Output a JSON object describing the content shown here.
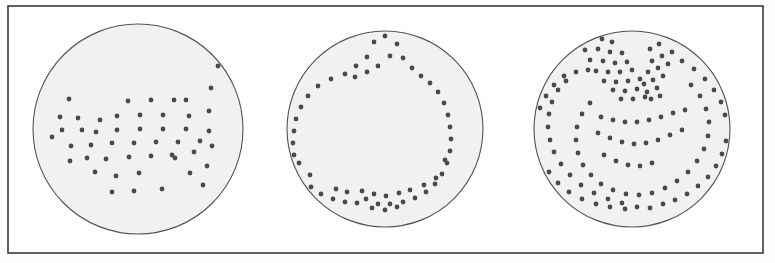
{
  "figure": {
    "background_color": "#fefefe",
    "frame": {
      "name": "outer-border",
      "x": 8,
      "y": 6,
      "width": 755,
      "height": 247,
      "stroke_color": "#3a3a3a",
      "stroke_width": 1.6,
      "fill_color": "#ffffff"
    },
    "disc_style": {
      "fill_color": "#f2f1ef",
      "stroke_color": "#55524e",
      "stroke_width": 1.1
    },
    "dot_style": {
      "fill_color": "#4a4a4a",
      "radius": 2.4
    }
  },
  "chart_data": {
    "type": "scatter",
    "xlabel": "",
    "ylabel": "",
    "xlim": [
      0,
      775
    ],
    "ylim": [
      263,
      0
    ],
    "grid": false,
    "legend": "none",
    "annotations": [
      "Panel 1 (left): loose rectangular lattice of dots forming an arrow-like / chevron cluster in the centre with an isolated vertical file of dots at the right.",
      "Panel 2 (middle): a single closed ring of dots tracing a rounded pentagon with a pointed apex at the top and a V notch at the bottom.",
      "Panel 3 (right): dense multi-layered pattern with a crossed X / butterfly motif at the top and nested arcs filling the lower half."
    ],
    "series": [
      {
        "name": "panel-1-dots",
        "marker": "circle",
        "color": "#4a4a4a",
        "count": 49,
        "center": [
          138,
          129
        ],
        "radius": 105,
        "points": [
          [
            128,
            101
          ],
          [
            151,
            100
          ],
          [
            174,
            100
          ],
          [
            117,
            116
          ],
          [
            140,
            115
          ],
          [
            163,
            115
          ],
          [
            69,
            99
          ],
          [
            60,
            117
          ],
          [
            78,
            118
          ],
          [
            62,
            130
          ],
          [
            82,
            130
          ],
          [
            100,
            120
          ],
          [
            96,
            132
          ],
          [
            117,
            130
          ],
          [
            140,
            129
          ],
          [
            163,
            129
          ],
          [
            186,
            129
          ],
          [
            71,
            146
          ],
          [
            91,
            145
          ],
          [
            112,
            143
          ],
          [
            134,
            143
          ],
          [
            156,
            142
          ],
          [
            178,
            142
          ],
          [
            200,
            141
          ],
          [
            70,
            161
          ],
          [
            106,
            159
          ],
          [
            129,
            157
          ],
          [
            151,
            156
          ],
          [
            194,
            152
          ],
          [
            172,
            155
          ],
          [
            116,
            176
          ],
          [
            139,
            173
          ],
          [
            95,
            172
          ],
          [
            112,
            192
          ],
          [
            134,
            191
          ],
          [
            162,
            189
          ],
          [
            207,
            166
          ],
          [
            203,
            185
          ],
          [
            209,
            131
          ],
          [
            209,
            111
          ],
          [
            211,
            88
          ],
          [
            212,
            146
          ],
          [
            218,
            66
          ],
          [
            186,
            100
          ],
          [
            189,
            116
          ],
          [
            175,
            158
          ],
          [
            190,
            173
          ],
          [
            52,
            137
          ],
          [
            87,
            158
          ]
        ]
      },
      {
        "name": "panel-2-ring",
        "marker": "circle",
        "color": "#4a4a4a",
        "count": 58,
        "center": [
          385,
          129
        ],
        "radius": 98,
        "points": [
          [
            385,
            36
          ],
          [
            374,
            42
          ],
          [
            397,
            44
          ],
          [
            367,
            57
          ],
          [
            390,
            56
          ],
          [
            403,
            58
          ],
          [
            356,
            66
          ],
          [
            378,
            66
          ],
          [
            412,
            68
          ],
          [
            345,
            74
          ],
          [
            367,
            72
          ],
          [
            421,
            76
          ],
          [
            331,
            79
          ],
          [
            355,
            77
          ],
          [
            430,
            83
          ],
          [
            318,
            86
          ],
          [
            438,
            92
          ],
          [
            308,
            96
          ],
          [
            444,
            103
          ],
          [
            301,
            107
          ],
          [
            448,
            115
          ],
          [
            296,
            119
          ],
          [
            450,
            127
          ],
          [
            294,
            131
          ],
          [
            451,
            139
          ],
          [
            293,
            143
          ],
          [
            450,
            151
          ],
          [
            294,
            155
          ],
          [
            447,
            163
          ],
          [
            297,
            167
          ],
          [
            442,
            174
          ],
          [
            303,
            178
          ],
          [
            435,
            184
          ],
          [
            311,
            187
          ],
          [
            426,
            192
          ],
          [
            321,
            194
          ],
          [
            415,
            198
          ],
          [
            333,
            199
          ],
          [
            403,
            202
          ],
          [
            345,
            202
          ],
          [
            390,
            204
          ],
          [
            357,
            203
          ],
          [
            378,
            204
          ],
          [
            366,
            199
          ],
          [
            372,
            208
          ],
          [
            385,
            210
          ],
          [
            397,
            207
          ],
          [
            362,
            191
          ],
          [
            374,
            194
          ],
          [
            386,
            196
          ],
          [
            399,
            193
          ],
          [
            410,
            190
          ],
          [
            347,
            192
          ],
          [
            336,
            189
          ],
          [
            424,
            185
          ],
          [
            436,
            178
          ],
          [
            310,
            175
          ],
          [
            299,
            163
          ],
          [
            445,
            160
          ]
        ]
      },
      {
        "name": "panel-3-dots",
        "marker": "circle",
        "color": "#4a4a4a",
        "count": 126,
        "center": [
          632,
          129
        ],
        "radius": 98,
        "points": [
          [
            592,
            41
          ],
          [
            602,
            39
          ],
          [
            612,
            42
          ],
          [
            585,
            50
          ],
          [
            598,
            49
          ],
          [
            610,
            52
          ],
          [
            622,
            53
          ],
          [
            590,
            60
          ],
          [
            603,
            61
          ],
          [
            615,
            63
          ],
          [
            627,
            62
          ],
          [
            596,
            71
          ],
          [
            608,
            72
          ],
          [
            620,
            72
          ],
          [
            632,
            70
          ],
          [
            604,
            81
          ],
          [
            616,
            82
          ],
          [
            628,
            81
          ],
          [
            640,
            79
          ],
          [
            613,
            90
          ],
          [
            625,
            91
          ],
          [
            637,
            89
          ],
          [
            621,
            99
          ],
          [
            633,
            99
          ],
          [
            645,
            97
          ],
          [
            668,
            40
          ],
          [
            659,
            44
          ],
          [
            650,
            49
          ],
          [
            672,
            52
          ],
          [
            662,
            56
          ],
          [
            652,
            61
          ],
          [
            668,
            64
          ],
          [
            658,
            68
          ],
          [
            648,
            72
          ],
          [
            663,
            76
          ],
          [
            653,
            80
          ],
          [
            644,
            84
          ],
          [
            657,
            88
          ],
          [
            647,
            92
          ],
          [
            651,
            99
          ],
          [
            660,
            96
          ],
          [
            564,
            76
          ],
          [
            576,
            72
          ],
          [
            588,
            70
          ],
          [
            554,
            85
          ],
          [
            566,
            81
          ],
          [
            546,
            96
          ],
          [
            558,
            90
          ],
          [
            540,
            108
          ],
          [
            552,
            102
          ],
          [
            537,
            121
          ],
          [
            549,
            114
          ],
          [
            536,
            134
          ],
          [
            548,
            127
          ],
          [
            538,
            147
          ],
          [
            550,
            140
          ],
          [
            542,
            160
          ],
          [
            554,
            152
          ],
          [
            549,
            172
          ],
          [
            561,
            164
          ],
          [
            558,
            183
          ],
          [
            570,
            175
          ],
          [
            569,
            192
          ],
          [
            581,
            185
          ],
          [
            582,
            199
          ],
          [
            594,
            193
          ],
          [
            596,
            204
          ],
          [
            608,
            199
          ],
          [
            610,
            207
          ],
          [
            622,
            203
          ],
          [
            625,
            209
          ],
          [
            637,
            207
          ],
          [
            650,
            208
          ],
          [
            663,
            204
          ],
          [
            675,
            200
          ],
          [
            687,
            194
          ],
          [
            698,
            186
          ],
          [
            708,
            177
          ],
          [
            716,
            166
          ],
          [
            722,
            154
          ],
          [
            726,
            141
          ],
          [
            727,
            128
          ],
          [
            725,
            115
          ],
          [
            721,
            102
          ],
          [
            714,
            90
          ],
          [
            705,
            79
          ],
          [
            694,
            69
          ],
          [
            682,
            61
          ],
          [
            691,
            85
          ],
          [
            700,
            96
          ],
          [
            706,
            109
          ],
          [
            709,
            122
          ],
          [
            708,
            136
          ],
          [
            704,
            149
          ],
          [
            697,
            161
          ],
          [
            688,
            172
          ],
          [
            677,
            181
          ],
          [
            665,
            188
          ],
          [
            652,
            193
          ],
          [
            639,
            195
          ],
          [
            626,
            194
          ],
          [
            613,
            190
          ],
          [
            601,
            184
          ],
          [
            591,
            175
          ],
          [
            583,
            165
          ],
          [
            578,
            153
          ],
          [
            576,
            140
          ],
          [
            577,
            127
          ],
          [
            582,
            114
          ],
          [
            590,
            103
          ],
          [
            601,
            117
          ],
          [
            613,
            120
          ],
          [
            625,
            122
          ],
          [
            637,
            122
          ],
          [
            649,
            120
          ],
          [
            661,
            117
          ],
          [
            673,
            113
          ],
          [
            685,
            110
          ],
          [
            598,
            133
          ],
          [
            610,
            138
          ],
          [
            622,
            142
          ],
          [
            634,
            144
          ],
          [
            646,
            143
          ],
          [
            658,
            140
          ],
          [
            670,
            135
          ],
          [
            682,
            130
          ],
          [
            604,
            155
          ],
          [
            616,
            161
          ],
          [
            628,
            165
          ],
          [
            640,
            166
          ],
          [
            652,
            163
          ]
        ]
      }
    ]
  }
}
